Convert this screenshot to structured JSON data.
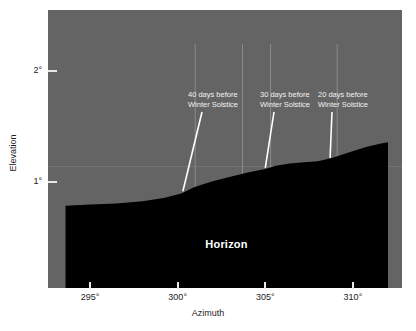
{
  "chart_data": {
    "type": "area",
    "title": "",
    "xlabel": "Azimuth",
    "ylabel": "Elevation",
    "xticks": [
      "295°",
      "300°",
      "305°",
      "310°"
    ],
    "xtick_values": [
      295,
      300,
      305,
      310
    ],
    "yticks": [
      "2°",
      "1°"
    ],
    "ytick_values": [
      2,
      1
    ],
    "xlim": [
      292.6,
      312.8
    ],
    "ylim": [
      0.05,
      2.55
    ],
    "grid": false,
    "legend": null,
    "series": [
      {
        "name": "Horizon",
        "fill_color": "#000000",
        "x": [
          293.6,
          295.0,
          296.5,
          298.0,
          299.2,
          300.2,
          301.0,
          302.0,
          303.0,
          304.0,
          305.0,
          305.6,
          306.4,
          307.2,
          308.0,
          308.8,
          309.8,
          310.8,
          311.6,
          312.0
        ],
        "y": [
          0.79,
          0.8,
          0.81,
          0.83,
          0.86,
          0.9,
          0.96,
          1.01,
          1.05,
          1.09,
          1.12,
          1.15,
          1.17,
          1.18,
          1.19,
          1.22,
          1.27,
          1.32,
          1.35,
          1.36
        ]
      }
    ],
    "annotations": [
      {
        "id": "annot-40-days",
        "line1": "40 days before",
        "line2": "Winter Solstice",
        "target_azimuth": 300.3,
        "target_elevation": 0.92
      },
      {
        "id": "annot-30-days",
        "line1": "30 days before",
        "line2": "Winter Solstice",
        "target_azimuth": 305.0,
        "target_elevation": 1.13
      },
      {
        "id": "annot-20-days",
        "line1": "20 days before",
        "line2": "Winter Solstice",
        "target_azimuth": 308.7,
        "target_elevation": 1.22
      }
    ],
    "sight_lines": [
      {
        "id": "sight-line-1",
        "azimuth": 301.0
      },
      {
        "id": "sight-line-2",
        "azimuth": 303.7
      },
      {
        "id": "sight-line-3",
        "azimuth": 305.3
      },
      {
        "id": "sight-line-4",
        "azimuth": 309.1
      }
    ],
    "horizon_label": "Horizon"
  },
  "colors": {
    "page_background": "#ffffff",
    "panel_background": "#646464",
    "horizon_fill": "#000000",
    "axis_text": "#1d1d1d",
    "annotation_text": "#f2f2f2",
    "leader_line": "#ffffff",
    "sight_line": "#8a8a8a",
    "tick_mark": "#e8e8e8"
  }
}
